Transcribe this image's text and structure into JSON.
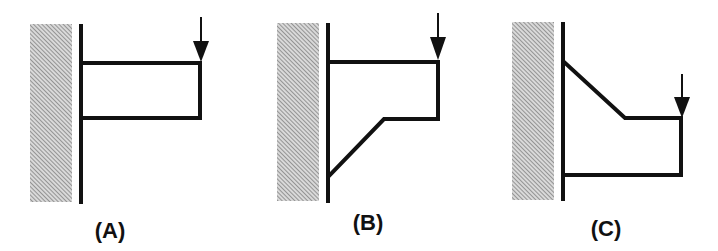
{
  "figure": {
    "panels": [
      {
        "id": "A",
        "label": "(A)",
        "description": "Rectangular bracket attached to wall; load applied at top right corner",
        "wall_hatch": {
          "x": 30,
          "y": 24,
          "w": 42,
          "h": 178
        },
        "wall_line": {
          "x": 81,
          "y1": 24,
          "y2": 204
        },
        "beam_path": "M81,63 L200,63 L200,118 L81,118",
        "arrow": {
          "x": 201,
          "y_top": 17,
          "head_top": 41,
          "head_bottom": 62
        },
        "label_pos": {
          "x": 110,
          "y": 238
        }
      },
      {
        "id": "B",
        "label": "(B)",
        "description": "Bracket with diagonal strut from lower wall to bottom edge; load at top right corner",
        "wall_hatch": {
          "x": 277,
          "y": 23,
          "w": 42,
          "h": 178
        },
        "wall_line": {
          "x": 328,
          "y1": 23,
          "y2": 203
        },
        "beam_path": "M328,62 L438,62 L438,119 L384,119 L329,176",
        "arrow": {
          "x": 438,
          "y_top": 13,
          "head_top": 37,
          "head_bottom": 60
        },
        "label_pos": {
          "x": 368,
          "y": 230
        }
      },
      {
        "id": "C",
        "label": "(C)",
        "description": "Bracket with diagonal top edge descending from wall; load at upper right corner",
        "wall_hatch": {
          "x": 512,
          "y": 22,
          "w": 42,
          "h": 178
        },
        "wall_line": {
          "x": 563,
          "y1": 22,
          "y2": 201
        },
        "beam_path": "M564,62 L625,118 L681,118 L681,175 L563,175",
        "arrow": {
          "x": 682,
          "y_top": 74,
          "head_top": 97,
          "head_bottom": 118
        },
        "label_pos": {
          "x": 606,
          "y": 236
        }
      }
    ],
    "colors": {
      "stroke": "#111111",
      "hatch_line": "#8a8a8a",
      "hatch_bg": "#d6d6d6",
      "background": "#ffffff"
    }
  }
}
